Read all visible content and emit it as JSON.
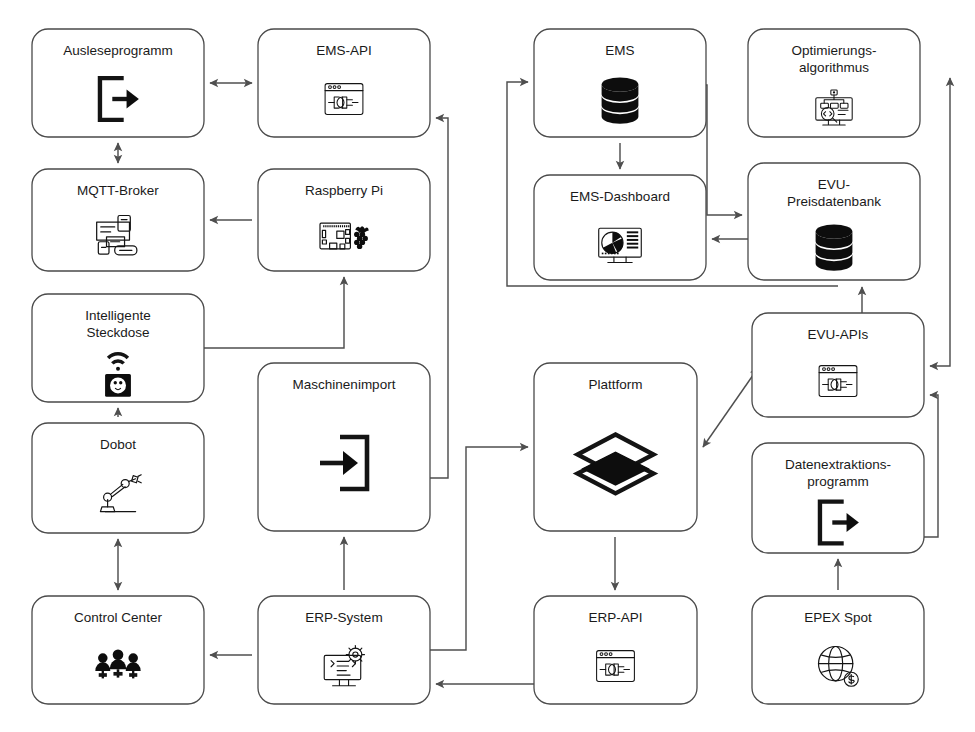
{
  "diagram": {
    "accent_color": "#0d0d0d",
    "box_stroke_color": "#4a4a4a",
    "edge_color": "#4f4f4f",
    "background_color": "#ffffff",
    "nodes": [
      {
        "id": "ausleseprogramm",
        "label": "Ausleseprogramm",
        "label_lines": [
          "Ausleseprogramm"
        ],
        "icon": "export-door-arrow-icon",
        "x": 32,
        "y": 29,
        "w": 172,
        "h": 108
      },
      {
        "id": "ems-api",
        "label": "EMS-API",
        "label_lines": [
          "EMS-API"
        ],
        "icon": "api-window-plug-icon",
        "x": 258,
        "y": 29,
        "w": 172,
        "h": 108
      },
      {
        "id": "ems",
        "label": "EMS",
        "label_lines": [
          "EMS"
        ],
        "icon": "database-icon",
        "x": 534,
        "y": 29,
        "w": 172,
        "h": 108
      },
      {
        "id": "optimierung",
        "label": "Optimierungsalgorithmus",
        "label_lines": [
          "Optimierungs-",
          "algorithmus"
        ],
        "icon": "algorithm-monitor-icon",
        "x": 748,
        "y": 29,
        "w": 172,
        "h": 108
      },
      {
        "id": "mqtt-broker",
        "label": "MQTT-Broker",
        "label_lines": [
          "MQTT-Broker"
        ],
        "icon": "message-broker-icon",
        "x": 32,
        "y": 169,
        "w": 172,
        "h": 102
      },
      {
        "id": "raspberry-pi",
        "label": "Raspberry Pi",
        "label_lines": [
          "Raspberry Pi"
        ],
        "icon": "raspberry-pi-board-icon",
        "x": 258,
        "y": 169,
        "w": 172,
        "h": 102
      },
      {
        "id": "ems-dashboard",
        "label": "EMS-Dashboard",
        "label_lines": [
          "EMS-Dashboard"
        ],
        "icon": "dashboard-piechart-icon",
        "x": 534,
        "y": 175,
        "w": 172,
        "h": 105
      },
      {
        "id": "evu-preisdb",
        "label": "EVU-Preisdatenbank",
        "label_lines": [
          "EVU-",
          "Preisdatenbank"
        ],
        "icon": "database-icon",
        "x": 748,
        "y": 163,
        "w": 172,
        "h": 117
      },
      {
        "id": "steckdose",
        "label": "Intelligente Steckdose",
        "label_lines": [
          "Intelligente",
          "Steckdose"
        ],
        "icon": "smart-socket-wifi-icon",
        "x": 32,
        "y": 294,
        "w": 172,
        "h": 108
      },
      {
        "id": "maschinenimport",
        "label": "Maschinenimport",
        "label_lines": [
          "Maschinenimport"
        ],
        "icon": "import-arrow-box-icon",
        "x": 258,
        "y": 363,
        "w": 172,
        "h": 168
      },
      {
        "id": "plattform",
        "label": "Plattform",
        "label_lines": [
          "Plattform"
        ],
        "icon": "layers-stack-icon",
        "x": 534,
        "y": 363,
        "w": 163,
        "h": 168
      },
      {
        "id": "evu-apis",
        "label": "EVU-APIs",
        "label_lines": [
          "EVU-APIs"
        ],
        "icon": "api-window-plug-icon",
        "x": 752,
        "y": 313,
        "w": 172,
        "h": 104
      },
      {
        "id": "dobot",
        "label": "Dobot",
        "label_lines": [
          "Dobot"
        ],
        "icon": "robot-arm-icon",
        "x": 32,
        "y": 423,
        "w": 172,
        "h": 110
      },
      {
        "id": "datenextraktion",
        "label": "Datenextraktionsprogramm",
        "label_lines": [
          "Datenextraktions-",
          "programm"
        ],
        "icon": "export-door-arrow-icon",
        "x": 752,
        "y": 443,
        "w": 172,
        "h": 110
      },
      {
        "id": "control-center",
        "label": "Control Center",
        "label_lines": [
          "Control Center"
        ],
        "icon": "people-group-icon",
        "x": 32,
        "y": 596,
        "w": 172,
        "h": 108
      },
      {
        "id": "erp-system",
        "label": "ERP-System",
        "label_lines": [
          "ERP-System"
        ],
        "icon": "erp-monitor-gear-icon",
        "x": 258,
        "y": 596,
        "w": 172,
        "h": 108
      },
      {
        "id": "erp-api",
        "label": "ERP-API",
        "label_lines": [
          "ERP-API"
        ],
        "icon": "api-window-plug-icon",
        "x": 534,
        "y": 596,
        "w": 163,
        "h": 108
      },
      {
        "id": "epex-spot",
        "label": "EPEX Spot",
        "label_lines": [
          "EPEX Spot"
        ],
        "icon": "globe-dollar-icon",
        "x": 752,
        "y": 596,
        "w": 172,
        "h": 108
      }
    ],
    "edges": [
      {
        "id": "e1",
        "from": "ausleseprogramm",
        "to": "ems-api",
        "type": "bidirectional",
        "path": "M 210 83 L 252 83"
      },
      {
        "id": "e2",
        "from": "mqtt-broker",
        "to": "ausleseprogramm",
        "type": "bidirectional",
        "path": "M 118 163 L 118 143"
      },
      {
        "id": "e3",
        "from": "raspberry-pi",
        "to": "mqtt-broker",
        "type": "directed",
        "path": "M 252 220 L 210 220"
      },
      {
        "id": "e4",
        "from": "steckdose",
        "to": "raspberry-pi",
        "type": "directed",
        "path": "M 204 348 L 344 348 L 344 277"
      },
      {
        "id": "e5",
        "from": "maschinenimport",
        "to": "ems-api",
        "type": "directed",
        "path": "M 430 478 L 448 478 L 448 118 L 436 118"
      },
      {
        "id": "e6",
        "from": "dobot",
        "to": "steckdose",
        "type": "directed",
        "path": "M 118 417 L 118 408"
      },
      {
        "id": "e7",
        "from": "control-center",
        "to": "dobot",
        "type": "bidirectional",
        "path": "M 118 590 L 118 539"
      },
      {
        "id": "e8",
        "from": "erp-system",
        "to": "control-center",
        "type": "directed",
        "path": "M 252 655 L 210 655"
      },
      {
        "id": "e9",
        "from": "erp-system",
        "to": "maschinenimport",
        "type": "directed",
        "path": "M 344 590 L 344 537"
      },
      {
        "id": "e10",
        "from": "erp-system",
        "to": "plattform",
        "type": "directed",
        "path": "M 430 650 L 466 650 L 466 447 L 528 447"
      },
      {
        "id": "e11",
        "from": "plattform",
        "to": "erp-api",
        "type": "directed",
        "path": "M 615 537 L 615 590"
      },
      {
        "id": "e12",
        "from": "erp-api",
        "to": "erp-system",
        "type": "directed",
        "path": "M 534 684 L 436 684"
      },
      {
        "id": "e13",
        "from": "plattform",
        "to": "evu-apis",
        "type": "bidirectional",
        "path": "M 703 447 L 758 368"
      },
      {
        "id": "e14",
        "from": "ems",
        "to": "ems-dashboard",
        "type": "directed",
        "path": "M 620 143 L 620 169"
      },
      {
        "id": "e15",
        "from": "ems",
        "to": "evu-preisdb",
        "type": "directed",
        "path": "M 706 85 L 707 85 L 707 215 L 742 215"
      },
      {
        "id": "e16",
        "from": "evu-preisdb",
        "to": "ems-dashboard",
        "type": "directed",
        "path": "M 748 239 L 712 239"
      },
      {
        "id": "e17",
        "from": "evu-preisdb",
        "to": "ems",
        "type": "directed",
        "path": "M 838 286 L 507 286 L 507 82 L 528 82"
      },
      {
        "id": "e18",
        "from": "evu-apis",
        "to": "evu-preisdb",
        "type": "directed",
        "path": "M 862 313 L 862 287"
      },
      {
        "id": "e19",
        "from": "optimierung",
        "to": "evu-apis",
        "type": "bidirectional",
        "path": "M 950 78 L 950 366 L 930 366"
      },
      {
        "id": "e20",
        "from": "datenextraktion",
        "to": "evu-apis",
        "type": "directed",
        "path": "M 924 537 L 938 537 L 938 395 L 930 395"
      },
      {
        "id": "e21",
        "from": "epex-spot",
        "to": "datenextraktion",
        "type": "directed",
        "path": "M 838 590 L 838 559"
      }
    ]
  }
}
